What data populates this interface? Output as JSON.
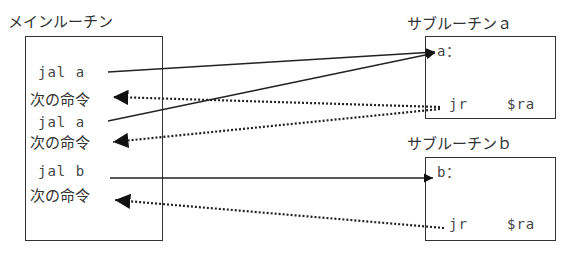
{
  "main": {
    "title": "メインルーチン",
    "lines": [
      "jal  a",
      "次の命令",
      "jal  a",
      "次の命令",
      "jal  b",
      "次の命令"
    ]
  },
  "sub_a": {
    "title": "サブルーチンａ",
    "label": "a：",
    "ret": "jr",
    "reg": "$ra"
  },
  "sub_b": {
    "title": "サブルーチンｂ",
    "label": "b：",
    "ret": "jr",
    "reg": "$ra"
  }
}
